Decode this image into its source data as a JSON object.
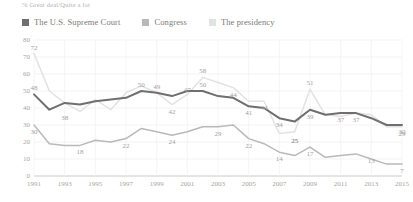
{
  "subtitle": "% Great deal/Quite a lot",
  "legend": {
    "position": "top-left",
    "items": [
      {
        "label": "The U.S. Supreme Court",
        "color": "#6f6f6f",
        "swatch": "legend-swatch-supreme-court"
      },
      {
        "label": "Congress",
        "color": "#b9b9b9",
        "swatch": "legend-swatch-congress"
      },
      {
        "label": "The presidency",
        "color": "#e2e2e2",
        "swatch": "legend-swatch-presidency"
      }
    ]
  },
  "chart_data": {
    "type": "line",
    "title": "",
    "subtitle": "% Great deal/Quite a lot",
    "xlabel": "",
    "ylabel": "",
    "ylim": [
      0,
      80
    ],
    "yticks": [
      0,
      10,
      20,
      30,
      40,
      50,
      60,
      70,
      80
    ],
    "grid": true,
    "legend_position": "top-left",
    "x": [
      1991,
      1992,
      1993,
      1994,
      1995,
      1996,
      1997,
      1998,
      1999,
      2000,
      2001,
      2002,
      2003,
      2004,
      2005,
      2006,
      2007,
      2008,
      2009,
      2010,
      2011,
      2012,
      2013,
      2014,
      2015
    ],
    "xticks": [
      1991,
      1993,
      1995,
      1997,
      1999,
      2001,
      2003,
      2005,
      2007,
      2009,
      2011,
      2013,
      2015
    ],
    "series": [
      {
        "name": "The U.S. Supreme Court",
        "color": "#6f6f6f",
        "values": [
          48,
          39,
          43,
          42,
          44,
          45,
          46,
          50,
          49,
          47,
          50,
          50,
          47,
          46,
          41,
          40,
          34,
          32,
          39,
          36,
          37,
          37,
          34,
          30,
          30
        ],
        "labeled_points": [
          {
            "x": 1991,
            "value": 48
          },
          {
            "x": 1998,
            "value": 50
          },
          {
            "x": 1999,
            "value": 49
          },
          {
            "x": 2001,
            "value": 47
          },
          {
            "x": 2002,
            "value": 50
          },
          {
            "x": 2004,
            "value": 44
          },
          {
            "x": 2005,
            "value": 41
          },
          {
            "x": 2007,
            "value": 34
          },
          {
            "x": 2008,
            "value": 25
          },
          {
            "x": 2009,
            "value": 39
          },
          {
            "x": 2011,
            "value": 37
          },
          {
            "x": 2012,
            "value": 37
          },
          {
            "x": 2015,
            "value": 30
          }
        ]
      },
      {
        "name": "Congress",
        "color": "#b9b9b9",
        "values": [
          30,
          19,
          18,
          18,
          21,
          20,
          22,
          28,
          26,
          24,
          26,
          29,
          29,
          30,
          22,
          19,
          14,
          12,
          17,
          11,
          12,
          13,
          10,
          7,
          7
        ],
        "labeled_points": [
          {
            "x": 1991,
            "value": 30
          },
          {
            "x": 1994,
            "value": 18
          },
          {
            "x": 1997,
            "value": 22
          },
          {
            "x": 2000,
            "value": 24
          },
          {
            "x": 2003,
            "value": 29
          },
          {
            "x": 2005,
            "value": 22
          },
          {
            "x": 2007,
            "value": 14
          },
          {
            "x": 2009,
            "value": 17
          },
          {
            "x": 2013,
            "value": 13
          },
          {
            "x": 2015,
            "value": 7
          }
        ]
      },
      {
        "name": "The presidency",
        "color": "#e2e2e2",
        "values": [
          72,
          50,
          43,
          38,
          45,
          39,
          49,
          53,
          49,
          42,
          48,
          58,
          55,
          52,
          44,
          44,
          25,
          26,
          51,
          36,
          35,
          37,
          36,
          29,
          29
        ],
        "labeled_points": [
          {
            "x": 1991,
            "value": 72
          },
          {
            "x": 1993,
            "value": 38
          },
          {
            "x": 2000,
            "value": 42
          },
          {
            "x": 2002,
            "value": 58
          },
          {
            "x": 2006,
            "value": 44
          },
          {
            "x": 2008,
            "value": 25
          },
          {
            "x": 2009,
            "value": 51
          },
          {
            "x": 2015,
            "value": 29
          }
        ]
      }
    ]
  }
}
